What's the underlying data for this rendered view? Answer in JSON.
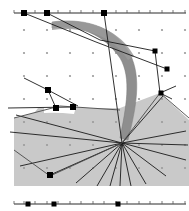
{
  "figure": {
    "title": "",
    "width": 189,
    "height": 211,
    "background": "#ffffff"
  },
  "colors": {
    "background": "#ffffff",
    "grid_dot": "#9a9a9a",
    "line": "#1a1a1a",
    "marker_fill": "#000000",
    "band_fill": "#8e8e8e",
    "band_edge": "#6f6f6f",
    "shaded_region": "#c9c9c9",
    "shaded_region_edge": "#555555",
    "axis": "#2b2b2b",
    "tick": "#555555"
  },
  "top_axis": {
    "name": "top-ruler",
    "y": 13,
    "x_start": 14,
    "x_end": 186,
    "ticks": [
      14,
      24,
      35,
      47,
      58,
      70,
      81,
      93,
      104,
      116,
      127,
      139,
      150,
      162,
      173,
      185
    ],
    "markers": [
      {
        "x": 24,
        "y": 13,
        "size": 6
      },
      {
        "x": 47,
        "y": 13,
        "size": 6
      },
      {
        "x": 104,
        "y": 13,
        "size": 6
      }
    ]
  },
  "bottom_axis": {
    "name": "bottom-ruler",
    "y": 204,
    "x_start": 14,
    "x_end": 186,
    "ticks": [
      14,
      24,
      35,
      47,
      58,
      70,
      81,
      93,
      104,
      116,
      127,
      139,
      150,
      162,
      173,
      185
    ],
    "markers": [
      {
        "x": 28,
        "y": 204,
        "size": 5
      },
      {
        "x": 54,
        "y": 204,
        "size": 5
      },
      {
        "x": 118,
        "y": 204,
        "size": 5
      }
    ]
  },
  "grid": {
    "name": "dot-grid",
    "x_origin": 24,
    "y_origin": 30,
    "spacing_x": 23,
    "spacing_y": 23,
    "cols": 8,
    "rows": 7,
    "dot_radius": 1.1
  },
  "convergence_point": {
    "name": "fan-origin",
    "x": 122,
    "y": 143
  },
  "fan_lines": [
    {
      "x2": 16,
      "y2": 115
    },
    {
      "x2": 10,
      "y2": 132
    },
    {
      "x2": 20,
      "y2": 166
    },
    {
      "x2": 50,
      "y2": 175
    },
    {
      "x2": 76,
      "y2": 183
    },
    {
      "x2": 97,
      "y2": 186
    },
    {
      "x2": 110,
      "y2": 186
    },
    {
      "x2": 120,
      "y2": 186
    },
    {
      "x2": 131,
      "y2": 186
    },
    {
      "x2": 146,
      "y2": 184
    },
    {
      "x2": 166,
      "y2": 176
    },
    {
      "x2": 186,
      "y2": 160
    },
    {
      "x2": 188,
      "y2": 145
    },
    {
      "x2": 186,
      "y2": 131
    },
    {
      "x2": 163,
      "y2": 96
    },
    {
      "x2": 104,
      "y2": 13
    }
  ],
  "upper_lines": [
    {
      "x1": 24,
      "y1": 13,
      "x2": 96,
      "y2": 42
    },
    {
      "x1": 47,
      "y1": 13,
      "x2": 100,
      "y2": 40
    },
    {
      "x1": 100,
      "y1": 40,
      "x2": 155,
      "y2": 51
    },
    {
      "x1": 96,
      "y1": 42,
      "x2": 167,
      "y2": 69
    },
    {
      "x1": 24,
      "y1": 78,
      "x2": 48,
      "y2": 90
    },
    {
      "x1": 48,
      "y1": 90,
      "x2": 78,
      "y2": 106
    },
    {
      "x1": 48,
      "y1": 90,
      "x2": 56,
      "y2": 108
    },
    {
      "x1": 8,
      "y1": 108,
      "x2": 73,
      "y2": 107
    },
    {
      "x1": 155,
      "y1": 51,
      "x2": 160,
      "y2": 93
    },
    {
      "x1": 160,
      "y1": 93,
      "x2": 176,
      "y2": 86
    },
    {
      "x1": 160,
      "y1": 93,
      "x2": 172,
      "y2": 99
    }
  ],
  "node_markers": [
    {
      "name": "node-top-1",
      "x": 24,
      "y": 13,
      "size": 6
    },
    {
      "name": "node-top-2",
      "x": 47,
      "y": 13,
      "size": 6
    },
    {
      "name": "node-top-3",
      "x": 104,
      "y": 13,
      "size": 6
    },
    {
      "name": "node-right-1",
      "x": 155,
      "y": 51,
      "size": 5
    },
    {
      "name": "node-right-2",
      "x": 167,
      "y": 69,
      "size": 5
    },
    {
      "name": "node-right-3",
      "x": 161,
      "y": 93,
      "size": 5
    },
    {
      "name": "node-left-1",
      "x": 48,
      "y": 90,
      "size": 6
    },
    {
      "name": "node-left-2",
      "x": 56,
      "y": 108,
      "size": 6
    },
    {
      "name": "node-left-3",
      "x": 73,
      "y": 107,
      "size": 6
    },
    {
      "name": "node-bottom-1",
      "x": 50,
      "y": 175,
      "size": 6
    }
  ],
  "band": {
    "name": "curved-band",
    "description": "thick gray curved ribbon sweeping from upper-left down to fan origin",
    "fill": "#8e8e8e"
  },
  "shaded_region": {
    "name": "shaded-polygon",
    "description": "light gray filled region occupying lower half of plot",
    "fill": "#c9c9c9"
  }
}
